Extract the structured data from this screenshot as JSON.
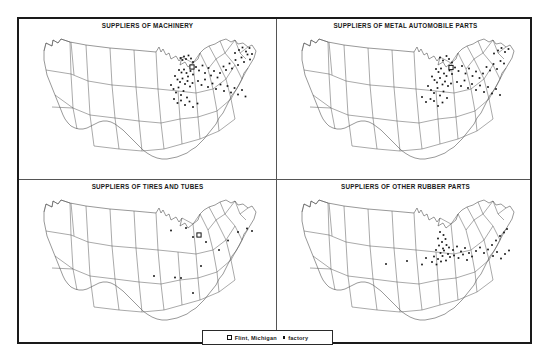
{
  "figure": {
    "panels": [
      {
        "id": "machinery",
        "title": "SUPPLIERS OF MACHINERY",
        "markers": {
          "factory_dots": [
            [
              150.5,
              29.0
            ],
            [
              152.5,
              31.0
            ],
            [
              154.0,
              27.5
            ],
            [
              156.0,
              30.0
            ],
            [
              158.5,
              26.5
            ],
            [
              161.0,
              29.5
            ],
            [
              163.0,
              33.0
            ],
            [
              149.0,
              41.0
            ],
            [
              151.5,
              43.5
            ],
            [
              154.0,
              40.5
            ],
            [
              156.5,
              44.0
            ],
            [
              158.0,
              47.5
            ],
            [
              160.5,
              42.0
            ],
            [
              163.0,
              45.5
            ],
            [
              145.0,
              47.0
            ],
            [
              147.5,
              50.5
            ],
            [
              150.0,
              53.0
            ],
            [
              152.5,
              49.5
            ],
            [
              155.0,
              55.0
            ],
            [
              157.5,
              52.0
            ],
            [
              160.0,
              57.5
            ],
            [
              162.5,
              54.0
            ],
            [
              141.0,
              56.0
            ],
            [
              143.5,
              60.0
            ],
            [
              146.0,
              63.5
            ],
            [
              148.5,
              58.5
            ],
            [
              151.0,
              66.0
            ],
            [
              153.5,
              62.0
            ],
            [
              157.0,
              68.5
            ],
            [
              166.0,
              38.0
            ],
            [
              169.0,
              41.5
            ],
            [
              172.5,
              36.5
            ],
            [
              175.0,
              44.0
            ],
            [
              178.5,
              39.0
            ],
            [
              181.0,
              46.5
            ],
            [
              184.0,
              42.0
            ],
            [
              187.5,
              48.5
            ],
            [
              190.0,
              44.0
            ],
            [
              193.5,
              37.5
            ],
            [
              196.0,
              41.0
            ],
            [
              199.5,
              34.5
            ],
            [
              202.0,
              39.5
            ],
            [
              205.5,
              31.0
            ],
            [
              208.0,
              36.0
            ],
            [
              211.5,
              28.5
            ],
            [
              214.0,
              33.0
            ],
            [
              217.5,
              25.5
            ],
            [
              220.0,
              30.5
            ],
            [
              205.0,
              24.0
            ],
            [
              209.0,
              21.0
            ],
            [
              212.5,
              18.5
            ],
            [
              216.0,
              22.5
            ],
            [
              219.5,
              19.0
            ],
            [
              222.0,
              25.0
            ],
            [
              168.0,
              52.0
            ],
            [
              171.5,
              56.0
            ],
            [
              175.0,
              50.5
            ],
            [
              178.0,
              58.0
            ],
            [
              182.5,
              54.5
            ],
            [
              186.0,
              60.0
            ],
            [
              190.5,
              55.5
            ],
            [
              194.0,
              62.0
            ],
            [
              197.5,
              57.0
            ],
            [
              201.0,
              63.5
            ],
            [
              204.5,
              59.0
            ],
            [
              208.0,
              65.5
            ],
            [
              212.0,
              61.0
            ],
            [
              215.5,
              67.5
            ],
            [
              144.0,
              70.0
            ],
            [
              147.5,
              74.0
            ],
            [
              151.0,
              71.5
            ],
            [
              155.0,
              76.0
            ],
            [
              159.5,
              72.5
            ],
            [
              163.0,
              78.0
            ],
            [
              167.5,
              74.5
            ]
          ],
          "flint_squares": [
            [
              162.0,
              38.0
            ]
          ]
        }
      },
      {
        "id": "metal-automobile-parts",
        "title": "SUPPLIERS OF METAL AUTOMOBILE PARTS",
        "markers": {
          "factory_dots": [
            [
              152.0,
              28.5
            ],
            [
              155.0,
              31.5
            ],
            [
              158.5,
              27.0
            ],
            [
              161.0,
              30.0
            ],
            [
              164.0,
              33.5
            ],
            [
              148.0,
              40.0
            ],
            [
              150.5,
              43.0
            ],
            [
              153.0,
              39.5
            ],
            [
              156.0,
              44.5
            ],
            [
              158.5,
              47.0
            ],
            [
              161.5,
              41.5
            ],
            [
              164.0,
              45.0
            ],
            [
              144.0,
              47.5
            ],
            [
              146.5,
              51.0
            ],
            [
              149.0,
              53.5
            ],
            [
              152.0,
              49.0
            ],
            [
              154.5,
              55.5
            ],
            [
              157.0,
              52.5
            ],
            [
              160.0,
              57.0
            ],
            [
              163.0,
              54.5
            ],
            [
              140.0,
              57.0
            ],
            [
              143.0,
              61.0
            ],
            [
              146.0,
              64.0
            ],
            [
              149.5,
              59.0
            ],
            [
              152.0,
              66.5
            ],
            [
              155.5,
              62.5
            ],
            [
              159.0,
              69.0
            ],
            [
              134.0,
              68.0
            ],
            [
              138.0,
              73.0
            ],
            [
              142.5,
              70.0
            ],
            [
              167.0,
              38.5
            ],
            [
              170.5,
              42.0
            ],
            [
              174.0,
              37.0
            ],
            [
              177.5,
              44.5
            ],
            [
              181.0,
              39.5
            ],
            [
              184.5,
              47.0
            ],
            [
              188.0,
              42.5
            ],
            [
              191.5,
              49.0
            ],
            [
              195.0,
              44.5
            ],
            [
              198.5,
              38.0
            ],
            [
              202.0,
              41.5
            ],
            [
              205.5,
              35.0
            ],
            [
              209.0,
              40.0
            ],
            [
              212.5,
              32.0
            ],
            [
              216.0,
              34.5
            ],
            [
              206.0,
              24.5
            ],
            [
              210.0,
              21.5
            ],
            [
              213.5,
              19.0
            ],
            [
              217.0,
              23.0
            ],
            [
              220.5,
              20.0
            ],
            [
              169.0,
              53.0
            ],
            [
              173.0,
              57.0
            ],
            [
              176.5,
              51.5
            ],
            [
              180.0,
              59.0
            ],
            [
              184.0,
              55.0
            ],
            [
              188.0,
              61.0
            ],
            [
              192.0,
              56.5
            ],
            [
              196.0,
              63.0
            ],
            [
              200.0,
              58.0
            ],
            [
              204.0,
              64.5
            ],
            [
              208.0,
              60.0
            ],
            [
              212.0,
              66.0
            ],
            [
              146.0,
              72.0
            ],
            [
              150.0,
              77.0
            ],
            [
              154.5,
              73.5
            ]
          ],
          "flint_squares": [
            [
              163.0,
              38.5
            ]
          ]
        }
      },
      {
        "id": "tires-and-tubes",
        "title": "SUPPLIERS OF TIRES AND TUBES",
        "markers": {
          "factory_dots": [
            [
              141.0,
              40.5
            ],
            [
              156.0,
              38.0
            ],
            [
              163.0,
              47.0
            ],
            [
              176.0,
              52.0
            ],
            [
              198.0,
              50.5
            ],
            [
              208.0,
              42.0
            ],
            [
              217.0,
              38.5
            ],
            [
              222.0,
              41.0
            ],
            [
              124.0,
              86.0
            ],
            [
              151.0,
              88.0
            ],
            [
              163.0,
              103.0
            ],
            [
              145.0,
              87.5
            ],
            [
              171.0,
              76.0
            ],
            [
              189.0,
              60.0
            ]
          ],
          "flint_squares": [
            [
              169.0,
              45.0
            ]
          ]
        }
      },
      {
        "id": "other-rubber-parts",
        "title": "SUPPLIERS OF OTHER RUBBER PARTS",
        "markers": {
          "factory_dots": [
            [
              152.0,
              42.0
            ],
            [
              155.5,
              45.0
            ],
            [
              150.0,
              48.5
            ],
            [
              154.0,
              52.0
            ],
            [
              157.5,
              49.0
            ],
            [
              151.0,
              55.5
            ],
            [
              155.0,
              58.5
            ],
            [
              158.5,
              55.0
            ],
            [
              148.0,
              60.0
            ],
            [
              152.5,
              63.0
            ],
            [
              156.0,
              60.5
            ],
            [
              160.0,
              64.0
            ],
            [
              146.0,
              66.5
            ],
            [
              150.0,
              69.0
            ],
            [
              154.5,
              66.0
            ],
            [
              158.0,
              70.5
            ],
            [
              162.0,
              67.0
            ],
            [
              144.0,
              72.0
            ],
            [
              148.5,
              74.5
            ],
            [
              153.0,
              71.5
            ],
            [
              161.0,
              57.5
            ],
            [
              165.0,
              60.0
            ],
            [
              169.0,
              56.5
            ],
            [
              173.0,
              61.5
            ],
            [
              177.0,
              58.0
            ],
            [
              181.0,
              63.0
            ],
            [
              166.0,
              65.5
            ],
            [
              170.5,
              68.0
            ],
            [
              175.0,
              64.5
            ],
            [
              179.0,
              70.0
            ],
            [
              184.0,
              66.5
            ],
            [
              188.0,
              61.0
            ],
            [
              192.0,
              57.5
            ],
            [
              196.0,
              63.0
            ],
            [
              200.0,
              59.5
            ],
            [
              204.0,
              55.0
            ],
            [
              208.0,
              50.5
            ],
            [
              212.0,
              46.0
            ],
            [
              216.0,
              42.5
            ],
            [
              219.0,
              39.0
            ],
            [
              205.0,
              66.0
            ],
            [
              209.0,
              62.0
            ],
            [
              213.0,
              68.5
            ],
            [
              217.0,
              64.0
            ],
            [
              221.0,
              60.5
            ],
            [
              119.0,
              71.0
            ],
            [
              98.0,
              74.0
            ],
            [
              138.0,
              68.0
            ],
            [
              134.0,
              74.5
            ]
          ],
          "flint_squares": []
        }
      }
    ],
    "legend": {
      "items": [
        {
          "marker": "square-icon",
          "label": "Flint, Michigan"
        },
        {
          "marker": "dot-icon",
          "label": "factory"
        }
      ]
    },
    "colors": {
      "frame": "#1a1a1a",
      "divider": "#555555",
      "marker": "#111111",
      "background": "#ffffff",
      "state_outline": "#444444"
    }
  }
}
